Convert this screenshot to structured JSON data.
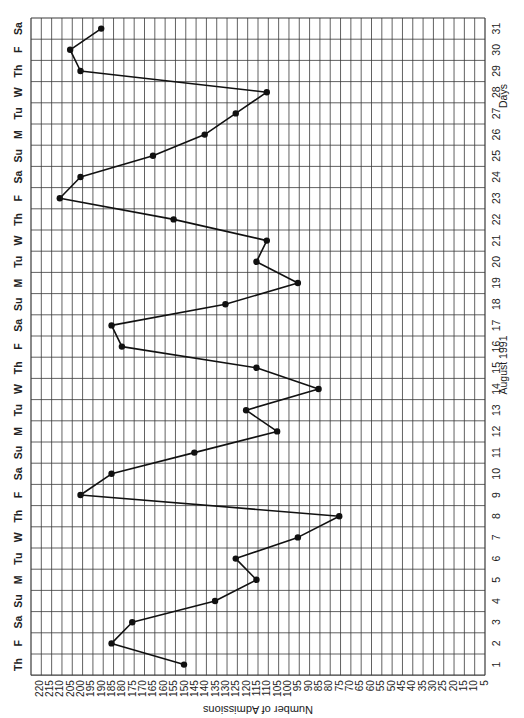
{
  "chart_data": {
    "type": "line",
    "orientation": "rotated-90-clockwise",
    "title": "",
    "xlabel": "Days",
    "xlabel_secondary": "August 1991",
    "ylabel": "Number of Admissions",
    "ylim": [
      5,
      220
    ],
    "y_ticks": [
      220,
      215,
      210,
      205,
      200,
      195,
      190,
      185,
      180,
      175,
      170,
      165,
      160,
      155,
      150,
      145,
      140,
      135,
      130,
      125,
      120,
      115,
      110,
      105,
      100,
      95,
      90,
      85,
      80,
      75,
      70,
      65,
      60,
      55,
      50,
      45,
      40,
      35,
      30,
      25,
      20,
      15,
      10,
      5
    ],
    "grid": true,
    "legend": null,
    "categories": [
      1,
      2,
      3,
      4,
      5,
      6,
      7,
      8,
      9,
      10,
      11,
      12,
      13,
      14,
      15,
      16,
      17,
      18,
      19,
      20,
      21,
      22,
      23,
      24,
      25,
      26,
      27,
      28,
      29,
      30,
      31
    ],
    "weekdays": [
      "Th",
      "F",
      "Sa",
      "Su",
      "M",
      "Tu",
      "W",
      "Th",
      "F",
      "Sa",
      "Su",
      "M",
      "Tu",
      "W",
      "Th",
      "F",
      "Sa",
      "Su",
      "M",
      "Tu",
      "W",
      "Th",
      "F",
      "Sa",
      "Su",
      "M",
      "Tu",
      "W",
      "Th",
      "F",
      "Sa"
    ],
    "series": [
      {
        "name": "Number of Admissions",
        "values": [
          150,
          185,
          175,
          135,
          115,
          125,
          95,
          75,
          200,
          185,
          145,
          105,
          120,
          85,
          115,
          180,
          185,
          130,
          95,
          115,
          110,
          155,
          210,
          200,
          165,
          140,
          125,
          110,
          200,
          205,
          190
        ]
      }
    ]
  },
  "labels": {
    "y_axis_title": "Number of Admissions",
    "x_axis_title": "Days",
    "x_axis_subtitle": "August 1991"
  }
}
